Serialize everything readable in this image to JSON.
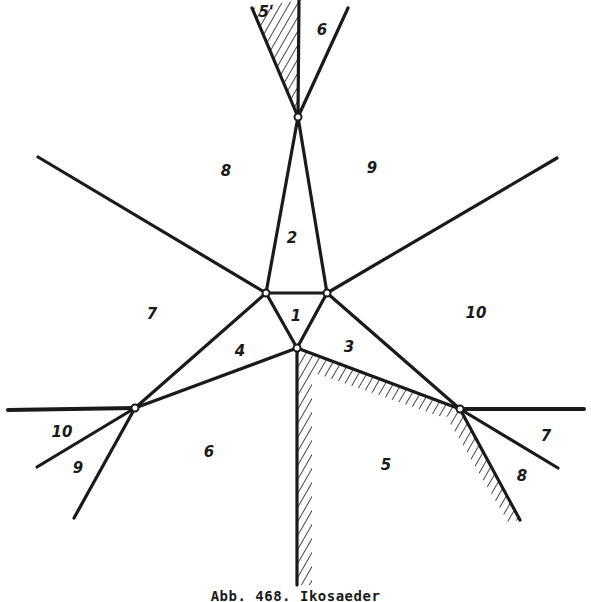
{
  "figure": {
    "caption": "Abb. 468. Ikosaeder",
    "ink_color": "#1a1a1a",
    "paper_color": "#ffffff",
    "labels": [
      {
        "id": "face-1",
        "text": "1",
        "x": 296,
        "y": 316
      },
      {
        "id": "face-2",
        "text": "2",
        "x": 292,
        "y": 238
      },
      {
        "id": "face-3",
        "text": "3",
        "x": 349,
        "y": 347
      },
      {
        "id": "face-4",
        "text": "4",
        "x": 240,
        "y": 351
      },
      {
        "id": "face-5",
        "text": "5",
        "x": 386,
        "y": 465
      },
      {
        "id": "face-5-prime",
        "text": "5'",
        "x": 266,
        "y": 12
      },
      {
        "id": "face-6-top",
        "text": "6",
        "x": 322,
        "y": 30
      },
      {
        "id": "face-6",
        "text": "6",
        "x": 209,
        "y": 452
      },
      {
        "id": "face-7-left",
        "text": "7",
        "x": 152,
        "y": 314
      },
      {
        "id": "face-7-right",
        "text": "7",
        "x": 546,
        "y": 436
      },
      {
        "id": "face-8-top",
        "text": "8",
        "x": 226,
        "y": 171
      },
      {
        "id": "face-8-right",
        "text": "8",
        "x": 522,
        "y": 476
      },
      {
        "id": "face-9-top",
        "text": "9",
        "x": 372,
        "y": 168
      },
      {
        "id": "face-9-left",
        "text": "9",
        "x": 78,
        "y": 468
      },
      {
        "id": "face-10-right",
        "text": "10",
        "x": 476,
        "y": 313
      },
      {
        "id": "face-10-left",
        "text": "10",
        "x": 62,
        "y": 432
      }
    ]
  }
}
